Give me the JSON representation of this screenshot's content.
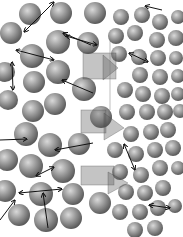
{
  "figure": {
    "colors": {
      "background": "#ffffff",
      "sphere_light": "#d6d6d6",
      "sphere_mid": "#8e8e8e",
      "sphere_dark": "#4a4a4a",
      "arrow": "#111111",
      "overlay": "#555555"
    },
    "large_spheres": [
      {
        "cx": 30,
        "cy": 14,
        "r": 11
      },
      {
        "cx": 61,
        "cy": 13,
        "r": 11
      },
      {
        "cx": 95,
        "cy": 13,
        "r": 11
      },
      {
        "cx": 11,
        "cy": 33,
        "r": 11
      },
      {
        "cx": 58,
        "cy": 42,
        "r": 12
      },
      {
        "cx": 88,
        "cy": 43,
        "r": 11
      },
      {
        "cx": 32,
        "cy": 56,
        "r": 12
      },
      {
        "cx": 5,
        "cy": 72,
        "r": 10
      },
      {
        "cx": 58,
        "cy": 72,
        "r": 12
      },
      {
        "cx": 34,
        "cy": 82,
        "r": 11
      },
      {
        "cx": 84,
        "cy": 89,
        "r": 12
      },
      {
        "cx": 8,
        "cy": 100,
        "r": 10
      },
      {
        "cx": 55,
        "cy": 104,
        "r": 11
      },
      {
        "cx": 33,
        "cy": 111,
        "r": 11
      },
      {
        "cx": 101,
        "cy": 117,
        "r": 11
      },
      {
        "cx": 26,
        "cy": 134,
        "r": 12
      },
      {
        "cx": 50,
        "cy": 145,
        "r": 12
      },
      {
        "cx": 79,
        "cy": 144,
        "r": 11
      },
      {
        "cx": 7,
        "cy": 160,
        "r": 11
      },
      {
        "cx": 31,
        "cy": 166,
        "r": 12
      },
      {
        "cx": 63,
        "cy": 171,
        "r": 12
      },
      {
        "cx": 5,
        "cy": 191,
        "r": 11
      },
      {
        "cx": 41,
        "cy": 194,
        "r": 12
      },
      {
        "cx": 73,
        "cy": 194,
        "r": 11
      },
      {
        "cx": 19,
        "cy": 215,
        "r": 11
      },
      {
        "cx": 46,
        "cy": 220,
        "r": 12
      },
      {
        "cx": 71,
        "cy": 218,
        "r": 11
      },
      {
        "cx": 100,
        "cy": 203,
        "r": 11
      }
    ],
    "small_spheres": [
      {
        "cx": 121,
        "cy": 17,
        "r": 8
      },
      {
        "cx": 142,
        "cy": 15,
        "r": 8
      },
      {
        "cx": 160,
        "cy": 22,
        "r": 8
      },
      {
        "cx": 178,
        "cy": 17,
        "r": 7
      },
      {
        "cx": 116,
        "cy": 36,
        "r": 8
      },
      {
        "cx": 135,
        "cy": 33,
        "r": 8
      },
      {
        "cx": 157,
        "cy": 40,
        "r": 8
      },
      {
        "cx": 176,
        "cy": 38,
        "r": 8
      },
      {
        "cx": 119,
        "cy": 54,
        "r": 8
      },
      {
        "cx": 139,
        "cy": 57,
        "r": 8
      },
      {
        "cx": 158,
        "cy": 58,
        "r": 8
      },
      {
        "cx": 176,
        "cy": 58,
        "r": 7
      },
      {
        "cx": 140,
        "cy": 75,
        "r": 8
      },
      {
        "cx": 160,
        "cy": 77,
        "r": 8
      },
      {
        "cx": 178,
        "cy": 76,
        "r": 7
      },
      {
        "cx": 125,
        "cy": 90,
        "r": 8
      },
      {
        "cx": 143,
        "cy": 94,
        "r": 8
      },
      {
        "cx": 162,
        "cy": 96,
        "r": 8
      },
      {
        "cx": 178,
        "cy": 94,
        "r": 7
      },
      {
        "cx": 127,
        "cy": 112,
        "r": 8
      },
      {
        "cx": 147,
        "cy": 112,
        "r": 8
      },
      {
        "cx": 165,
        "cy": 112,
        "r": 8
      },
      {
        "cx": 180,
        "cy": 111,
        "r": 7
      },
      {
        "cx": 131,
        "cy": 134,
        "r": 8
      },
      {
        "cx": 151,
        "cy": 132,
        "r": 8
      },
      {
        "cx": 168,
        "cy": 130,
        "r": 8
      },
      {
        "cx": 115,
        "cy": 150,
        "r": 8
      },
      {
        "cx": 136,
        "cy": 154,
        "r": 8
      },
      {
        "cx": 155,
        "cy": 150,
        "r": 8
      },
      {
        "cx": 173,
        "cy": 148,
        "r": 8
      },
      {
        "cx": 120,
        "cy": 172,
        "r": 8
      },
      {
        "cx": 141,
        "cy": 175,
        "r": 8
      },
      {
        "cx": 160,
        "cy": 168,
        "r": 8
      },
      {
        "cx": 178,
        "cy": 168,
        "r": 7
      },
      {
        "cx": 126,
        "cy": 192,
        "r": 8
      },
      {
        "cx": 145,
        "cy": 193,
        "r": 8
      },
      {
        "cx": 163,
        "cy": 188,
        "r": 8
      },
      {
        "cx": 120,
        "cy": 212,
        "r": 8
      },
      {
        "cx": 140,
        "cy": 212,
        "r": 8
      },
      {
        "cx": 158,
        "cy": 208,
        "r": 8
      },
      {
        "cx": 175,
        "cy": 206,
        "r": 7
      },
      {
        "cx": 135,
        "cy": 230,
        "r": 8
      },
      {
        "cx": 155,
        "cy": 228,
        "r": 8
      }
    ],
    "double_arrows": [
      {
        "x1": 54,
        "y1": 2,
        "x2": 24,
        "y2": 32
      },
      {
        "x1": 16,
        "y1": 50,
        "x2": 54,
        "y2": 60
      },
      {
        "x1": 12,
        "y1": 62,
        "x2": 13,
        "y2": 90
      },
      {
        "x1": 66,
        "y1": 36,
        "x2": 97,
        "y2": 45
      },
      {
        "x1": 129,
        "y1": 53,
        "x2": 148,
        "y2": 62
      },
      {
        "x1": 124,
        "y1": 144,
        "x2": 135,
        "y2": 170
      },
      {
        "x1": 36,
        "y1": 176,
        "x2": 54,
        "y2": 167
      },
      {
        "x1": 19,
        "y1": 193,
        "x2": 62,
        "y2": 189
      },
      {
        "x1": 149,
        "y1": 205,
        "x2": 170,
        "y2": 208
      }
    ],
    "single_arrows": [
      {
        "x1": 91,
        "y1": 45,
        "x2": 63,
        "y2": 33
      },
      {
        "x1": 93,
        "y1": 93,
        "x2": 62,
        "y2": 80
      },
      {
        "x1": 0,
        "y1": 140,
        "x2": 27,
        "y2": 139
      },
      {
        "x1": 93,
        "y1": 143,
        "x2": 55,
        "y2": 150
      },
      {
        "x1": 48,
        "y1": 228,
        "x2": 43,
        "y2": 193
      },
      {
        "x1": 0,
        "y1": 220,
        "x2": 15,
        "y2": 200
      },
      {
        "x1": 162,
        "y1": 10,
        "x2": 145,
        "y2": 6
      }
    ],
    "overlay_boxes": [
      {
        "x": 83,
        "y": 53,
        "w": 33,
        "h": 26
      },
      {
        "x": 81,
        "y": 110,
        "w": 25,
        "h": 23
      },
      {
        "x": 81,
        "y": 166,
        "w": 33,
        "h": 19
      }
    ],
    "overlay_arrows": [
      {
        "points": "103,55 118,68 103,80"
      },
      {
        "points": "104,113 124,128 104,140"
      },
      {
        "points": "108,172 128,183 108,194"
      }
    ],
    "vertical_guides": [
      {
        "x": 110,
        "y1": 40,
        "y2": 110
      }
    ]
  }
}
